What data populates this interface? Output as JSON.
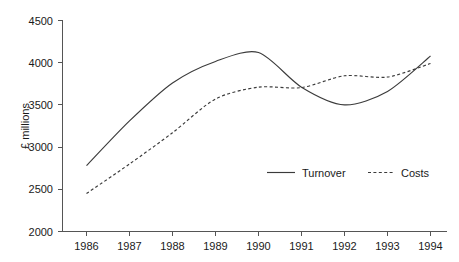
{
  "chart_data": {
    "type": "line",
    "title": "",
    "xlabel": "",
    "ylabel": "£ millions",
    "categories": [
      "1986",
      "1987",
      "1988",
      "1989",
      "1990",
      "1991",
      "1992",
      "1993",
      "1994"
    ],
    "x": [
      1986,
      1987,
      1988,
      1989,
      1990,
      1991,
      1992,
      1993,
      1994
    ],
    "xlim": [
      1986,
      1994
    ],
    "ylim": [
      2000,
      4500
    ],
    "yticks": [
      "2000",
      "2500",
      "3000",
      "3500",
      "4000",
      "4500"
    ],
    "ytick_values": [
      2000,
      2500,
      3000,
      3500,
      4000,
      4500
    ],
    "grid": false,
    "legend_position": "inside-lower-right",
    "series": [
      {
        "name": "Turnover",
        "style": "solid",
        "color": "#3b3b3b",
        "values": [
          2780,
          3310,
          3760,
          4015,
          4120,
          3710,
          3500,
          3660,
          4080
        ]
      },
      {
        "name": "Costs",
        "style": "dashed",
        "color": "#3b3b3b",
        "values": [
          2450,
          2800,
          3170,
          3570,
          3710,
          3705,
          3845,
          3830,
          3990
        ]
      }
    ]
  },
  "legend": {
    "entries": [
      {
        "label": "Turnover"
      },
      {
        "label": "Costs"
      }
    ]
  },
  "axes": {
    "y_title": "£ millions"
  }
}
